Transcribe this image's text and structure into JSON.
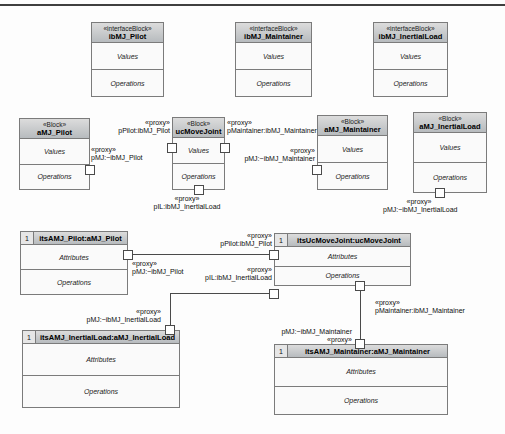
{
  "diagram": {
    "interface_blocks": [
      {
        "stereotype": "«interfaceBlock»",
        "name": "ibMJ_Pilot",
        "values_label": "Values",
        "operations_label": "Operations"
      },
      {
        "stereotype": "«interfaceBlock»",
        "name": "ibMJ_Maintainer",
        "values_label": "Values",
        "operations_label": "Operations"
      },
      {
        "stereotype": "«interfaceBlock»",
        "name": "ibMJ_InertialLoad",
        "values_label": "Values",
        "operations_label": "Operations"
      }
    ],
    "blocks": [
      {
        "stereotype": "«Block»",
        "name": "aMJ_Pilot",
        "values_label": "Values",
        "operations_label": "Operations"
      },
      {
        "stereotype": "«Block»",
        "name": "ucMoveJoint",
        "values_label": "Values",
        "operations_label": "Operations"
      },
      {
        "stereotype": "«Block»",
        "name": "aMJ_Maintainer",
        "values_label": "Values",
        "operations_label": "Operations"
      },
      {
        "stereotype": "«Block»",
        "name": "aMJ_InertialLoad",
        "values_label": "Values",
        "operations_label": "Operations"
      }
    ],
    "instances": [
      {
        "multiplicity": "1",
        "name": "itsAMJ_Pilot:aMJ_Pilot",
        "attributes_label": "Attributes",
        "operations_label": "Operations"
      },
      {
        "multiplicity": "1",
        "name": "itsUcMoveJoint:ucMoveJoint",
        "attributes_label": "Attributes",
        "operations_label": "Operations"
      },
      {
        "multiplicity": "1",
        "name": "itsAMJ_InertialLoad:aMJ_InertialLoad",
        "attributes_label": "Attributes",
        "operations_label": "Operations"
      },
      {
        "multiplicity": "1",
        "name": "itsAMJ_Maintainer:aMJ_Maintainer",
        "attributes_label": "Attributes",
        "operations_label": "Operations"
      }
    ],
    "port_labels": {
      "amj_pilot_port": {
        "stereotype": "«proxy»",
        "name": "pMJ:~ibMJ_Pilot"
      },
      "uc_ppilot": {
        "stereotype": "«proxy»",
        "name": "pPilot:ibMJ_Pilot"
      },
      "uc_pmaintainer": {
        "stereotype": "«proxy»",
        "name": "pMaintainer:ibMJ_Maintainer"
      },
      "amj_maintainer_port": {
        "stereotype": "«proxy»",
        "name": "pMJ:~ibMJ_Maintainer"
      },
      "uc_pil": {
        "stereotype": "«proxy»",
        "name": "pIL:ibMJ_InertialLoad"
      },
      "amj_inertialload_port": {
        "stereotype": "«proxy»",
        "name": "pMJ:~ibMJ_InertialLoad"
      },
      "its_pilot_port": {
        "stereotype": "«proxy»",
        "name": "pMJ:~ibMJ_Pilot"
      },
      "its_uc_ppilot": {
        "stereotype": "«proxy»",
        "name": "pPilot:ibMJ_Pilot"
      },
      "its_uc_pil": {
        "stereotype": "«proxy»",
        "name": "pIL:ibMJ_InertialLoad"
      },
      "its_inertialload_port": {
        "stereotype": "«proxy»",
        "name": "pMJ:~ibMJ_InertialLoad"
      },
      "its_uc_pmaintainer": {
        "stereotype": "«proxy»",
        "name": "pMaintainer:ibMJ_Maintainer"
      },
      "its_maintainer_port": {
        "stereotype": "«proxy»",
        "name": "pMJ:~ibMJ_Maintainer"
      }
    },
    "colors": {
      "header_fill": "#c6cacd",
      "block_border": "#7b7b7b",
      "connector": "#4a4a4a",
      "port_fill": "#ffffff",
      "background": "#fdfdfd"
    }
  }
}
